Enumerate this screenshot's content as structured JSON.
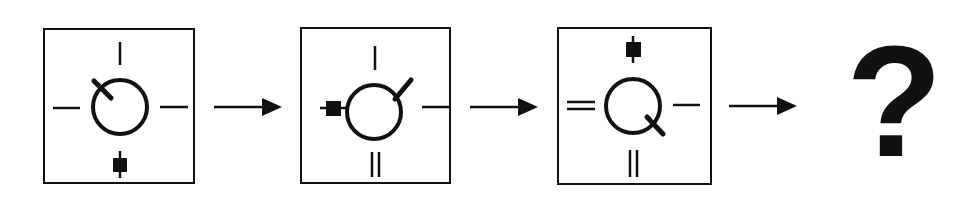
{
  "puzzle": {
    "type": "sequence-pattern",
    "stroke_color": "#111111",
    "background_color": "#ffffff",
    "panels": [
      {
        "index": 1,
        "x": 43,
        "y": 28,
        "w": 152,
        "h": 156,
        "circle_stroke_position": "upper-left",
        "top": "single-line",
        "left": "single-line",
        "right": "single-line",
        "bottom": "square"
      },
      {
        "index": 2,
        "x": 300,
        "y": 27,
        "w": 151,
        "h": 157,
        "circle_stroke_position": "upper-right",
        "top": "single-line",
        "left": "square",
        "right": "single-line",
        "bottom": "double-line"
      },
      {
        "index": 3,
        "x": 557,
        "y": 27,
        "w": 155,
        "h": 158,
        "circle_stroke_position": "lower-right",
        "top": "square",
        "left": "double-line",
        "right": "single-line",
        "bottom": "double-line"
      }
    ],
    "arrows": [
      {
        "x1": 214,
        "x2": 281,
        "y": 107
      },
      {
        "x1": 470,
        "x2": 538,
        "y": 107
      },
      {
        "x1": 729,
        "x2": 797,
        "y": 106
      }
    ],
    "answer_placeholder": "?"
  }
}
